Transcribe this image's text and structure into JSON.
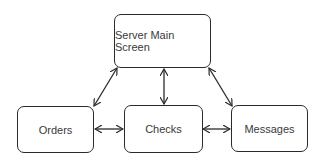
{
  "diagram": {
    "nodes": [
      {
        "id": "server_main_screen",
        "label": "Server Main Screen"
      },
      {
        "id": "orders",
        "label": "Orders"
      },
      {
        "id": "checks",
        "label": "Checks"
      },
      {
        "id": "messages",
        "label": "Messages"
      }
    ],
    "edges": [
      {
        "from": "server_main_screen",
        "to": "orders",
        "bidirectional": true
      },
      {
        "from": "server_main_screen",
        "to": "checks",
        "bidirectional": true
      },
      {
        "from": "server_main_screen",
        "to": "messages",
        "bidirectional": true
      },
      {
        "from": "orders",
        "to": "checks",
        "bidirectional": true
      },
      {
        "from": "checks",
        "to": "messages",
        "bidirectional": true
      }
    ],
    "colors": {
      "stroke": "#2b2b2b",
      "text": "#3a3a3a",
      "background": "#ffffff"
    }
  }
}
